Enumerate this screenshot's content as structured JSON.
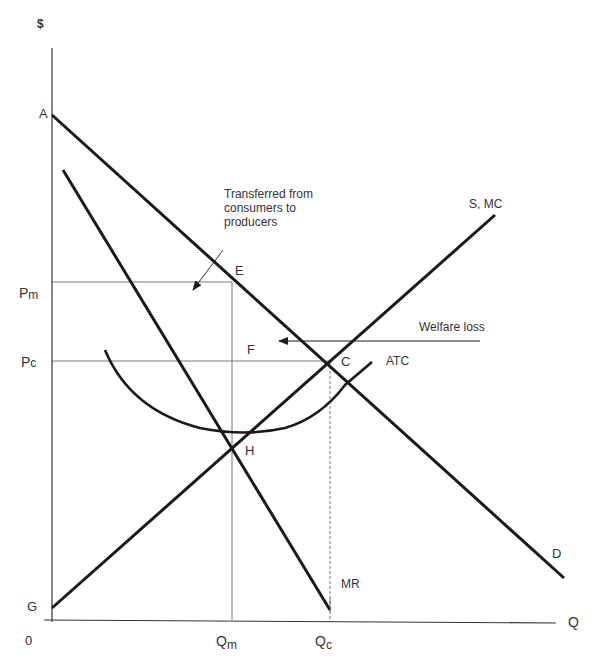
{
  "diagram": {
    "type": "monopoly-welfare-loss",
    "axes": {
      "y_label": "$",
      "x_label": "Q",
      "origin_label": "0"
    },
    "price_labels": {
      "pm_main": "P",
      "pm_sub": "m",
      "pc_main": "P",
      "pc_sub": "c"
    },
    "quantity_labels": {
      "qm_main": "Q",
      "qm_sub": "m",
      "qc_main": "Q",
      "qc_sub": "c"
    },
    "points": {
      "A": "A",
      "E": "E",
      "F": "F",
      "C": "C",
      "H": "H",
      "G": "G"
    },
    "curves": {
      "demand": "D",
      "marginal_revenue": "MR",
      "supply_mc": "S, MC",
      "atc": "ATC"
    },
    "annotations": {
      "transfer_line1": "Transferred from",
      "transfer_line2": "consumers to",
      "transfer_line3": "producers",
      "welfare_loss": "Welfare loss"
    },
    "colors": {
      "curve": "#1a1a1a",
      "guide": "#555555",
      "text": "#333333"
    }
  }
}
